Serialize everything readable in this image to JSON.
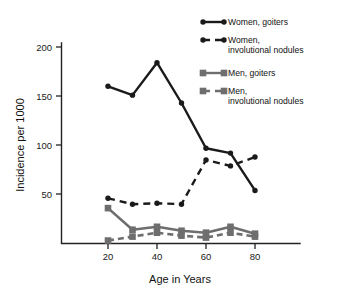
{
  "chart_data": {
    "type": "line",
    "title": "",
    "subtitle": "",
    "xlabel": "Age in Years",
    "ylabel": "Incidence per 1000",
    "x": [
      20,
      30,
      40,
      50,
      60,
      70,
      80
    ],
    "xlim": [
      15,
      85
    ],
    "ylim": [
      0,
      205
    ],
    "xticks": [
      20,
      40,
      60,
      80
    ],
    "xtick_labels": [
      "20",
      "40",
      "60",
      "80"
    ],
    "yticks": [
      50,
      100,
      150,
      200
    ],
    "ytick_labels": [
      "50",
      "100",
      "150",
      "200"
    ],
    "grid": false,
    "legend_position": "top-right",
    "series": [
      {
        "name": "Women, goiters",
        "color": "#1a1a1a",
        "style": "solid",
        "marker": "circle",
        "x": [
          20,
          30,
          40,
          50,
          60,
          70,
          80
        ],
        "values": [
          160,
          151,
          184,
          143,
          97,
          92,
          54
        ]
      },
      {
        "name": "Women, involutional nodules",
        "color": "#1a1a1a",
        "style": "dashed",
        "marker": "circle",
        "x": [
          20,
          30,
          40,
          50,
          60,
          70,
          80
        ],
        "values": [
          46,
          40,
          41,
          40,
          85,
          79,
          88
        ]
      },
      {
        "name": "Men, goiters",
        "color": "#6e6e6e",
        "style": "solid",
        "marker": "square",
        "x": [
          20,
          30,
          40,
          50,
          60,
          70,
          80
        ],
        "values": [
          36,
          14,
          17,
          13,
          11,
          17,
          10
        ]
      },
      {
        "name": "Men, involutional nodules",
        "color": "#6e6e6e",
        "style": "dashed",
        "marker": "square",
        "x": [
          20,
          30,
          40,
          50,
          60,
          70,
          80
        ],
        "values": [
          3,
          7,
          11,
          8,
          6,
          11,
          7
        ]
      }
    ]
  },
  "axes": {
    "y_title": "Incidence per 1000",
    "x_title": "Age in Years",
    "ytick_0": "200",
    "ytick_1": "150",
    "ytick_2": "100",
    "ytick_3": "50",
    "xtick_0": "20",
    "xtick_1": "40",
    "xtick_2": "60",
    "xtick_3": "80"
  },
  "legend": {
    "entries": [
      {
        "label_line1": "Women, goiters",
        "label_line2": ""
      },
      {
        "label_line1": "Women,",
        "label_line2": "involutional nodules"
      },
      {
        "label_line1": "Men, goiters",
        "label_line2": ""
      },
      {
        "label_line1": "Men,",
        "label_line2": "involutional nodules"
      }
    ]
  },
  "colors": {
    "women": "#1a1a1a",
    "men": "#6e6e6e",
    "axis": "#222222",
    "background": "#ffffff"
  }
}
